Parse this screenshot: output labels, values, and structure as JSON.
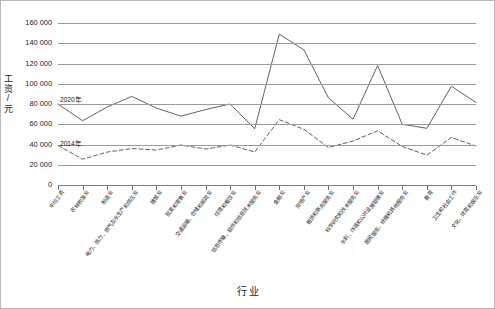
{
  "chart_data": {
    "type": "line",
    "title": "",
    "xlabel": "行业",
    "ylabel": "工资/元",
    "ylim": [
      0,
      160000
    ],
    "ytick_step": 20000,
    "grid": true,
    "legend_position": "inline-left",
    "y_tick_labels": [
      "160 000",
      "140 000",
      "120 000",
      "100 000",
      "80 000",
      "60 000",
      "40 000",
      "20 000",
      "0"
    ],
    "y_tick_values": [
      160000,
      140000,
      120000,
      100000,
      80000,
      60000,
      40000,
      20000,
      0
    ],
    "categories": [
      "平均工资",
      "农林牧渔业",
      "制造业",
      "电力、热力、燃气及水生产和供应业",
      "建筑业",
      "批发和零售业",
      "交通运输、仓储和邮政业",
      "住宿和餐饮业",
      "信息传输、软件和信息技术服务业",
      "金融业",
      "房地产业",
      "租赁和商务服务业",
      "科学研究和技术服务业",
      "水利、环境和公共设施管理业",
      "居民服务、修理和其他服务业",
      "教育",
      "卫生和社会工作",
      "文化、体育和娱乐业"
    ],
    "series": [
      {
        "name": "2020年",
        "style": "solid",
        "color": "#4f4f4f",
        "values": [
          80000,
          63500,
          77000,
          87500,
          76000,
          68000,
          74500,
          80000,
          55500,
          149000,
          133500,
          86000,
          65000,
          118000,
          60000,
          56000,
          97500,
          81500
        ]
      },
      {
        "name": "2014年",
        "style": "dashed",
        "color": "#4f4f4f",
        "values": [
          39000,
          25500,
          32500,
          36000,
          34500,
          39500,
          35500,
          39500,
          32500,
          64500,
          55000,
          37000,
          43500,
          53500,
          38000,
          29500,
          47000,
          38500
        ]
      }
    ]
  }
}
